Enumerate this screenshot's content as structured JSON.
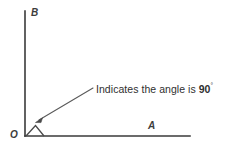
{
  "diagram": {
    "type": "right-angle-geometry",
    "background_color": "#ffffff",
    "line_color": "#3a3a3a",
    "text_color": "#2f2f2f",
    "labels": {
      "vertical_axis": "B",
      "horizontal_axis": "A",
      "origin": "O"
    },
    "annotation": {
      "prefix": "Indicates the angle is ",
      "value": "90",
      "degree_symbol": "°",
      "full_text": "Indicates the angle is 90°"
    },
    "geometry": {
      "origin_x": 25,
      "origin_y": 136,
      "vertical_axis_top_y": 11,
      "horizontal_axis_right_x": 190,
      "angle_marker_points": "26,136 35,126 44,136",
      "leader_start_x": 93,
      "leader_start_y": 88,
      "leader_end_x": 37,
      "leader_end_y": 121
    }
  }
}
